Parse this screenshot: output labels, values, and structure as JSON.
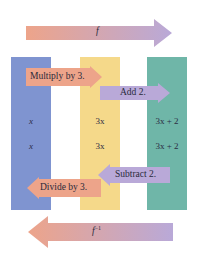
{
  "colors": {
    "column_1": "#7f94d0",
    "column_2": "#f5d98a",
    "column_3": "#6fb6a8",
    "arrow_salmon": "#eda48a",
    "arrow_lavender": "#b9a9d8",
    "text": "#2c2c44"
  },
  "top_arrow": {
    "label": "f",
    "direction": "right"
  },
  "bottom_arrow": {
    "label": "f",
    "superscript": "−1",
    "direction": "left"
  },
  "forward_steps": [
    {
      "label": "Multiply by 3.",
      "direction": "right"
    },
    {
      "label": "Add 2.",
      "direction": "right"
    }
  ],
  "inverse_steps": [
    {
      "label": "Subtract 2.",
      "direction": "left"
    },
    {
      "label": "Divide by 3.",
      "direction": "left"
    }
  ],
  "columns": [
    {
      "values": [
        "x",
        "x"
      ]
    },
    {
      "values": [
        "3x",
        "3x"
      ]
    },
    {
      "values": [
        "3x + 2",
        "3x + 2"
      ]
    }
  ]
}
